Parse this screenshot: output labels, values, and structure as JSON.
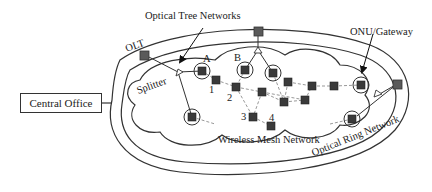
{
  "diagram": {
    "labels": {
      "central_office": "Central Office",
      "optical_tree": "Optical Tree Networks",
      "olt": "OLT",
      "splitter": "Splitter",
      "onu_gateway": "ONU/Gateway",
      "wireless_mesh": "Wireless Mesh Network",
      "optical_ring": "Optical Ring Network"
    },
    "node_labels": {
      "a": "A",
      "b": "B",
      "n1": "1",
      "n2": "2",
      "n3": "3",
      "n4": "4"
    },
    "colors": {
      "line": "#333333",
      "node_fill": "#3a3a3a",
      "olt_fill": "#5a5a5a",
      "mesh_link": "#999999"
    }
  }
}
